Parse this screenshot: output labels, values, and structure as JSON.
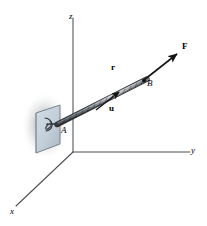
{
  "figure": {
    "type": "free-body-diagram",
    "background_color": "#ffffff",
    "stroke_color": "#1a1a1a",
    "plate_color": "#c3cfdb",
    "plate_edge_color": "#6e7a86",
    "shadow_color": "#b9bcc0"
  },
  "axes": {
    "origin": {
      "x": 73,
      "y": 152
    },
    "labels": {
      "x": "x",
      "y": "y",
      "z": "z"
    },
    "endpoints": {
      "x": {
        "x": 16,
        "y": 206
      },
      "y": {
        "x": 190,
        "y": 152
      },
      "z": {
        "x": 73,
        "y": 18
      }
    }
  },
  "points": [
    {
      "name": "A",
      "label": "A",
      "x": 62,
      "y": 128,
      "description": "cable anchor at eyebolt on plate"
    },
    {
      "name": "B",
      "label": "B",
      "x": 146,
      "y": 80,
      "description": "point along the cable"
    }
  ],
  "vectors": [
    {
      "name": "F",
      "label": "F",
      "bold": true,
      "label_x": 183,
      "label_y": 47,
      "description": "force vector acting along cable beyond B"
    },
    {
      "name": "r",
      "label": "r",
      "bold": true,
      "label_x": 112,
      "label_y": 67,
      "description": "position vector from A to B"
    },
    {
      "name": "u",
      "label": "u",
      "bold": true,
      "label_x": 110,
      "label_y": 107,
      "description": "unit vector in direction of the cable"
    }
  ],
  "elements": {
    "plate": "mounting-plate",
    "eyebolt": "eyebolt-at-A",
    "cable": "braided-cable-A-to-B",
    "shadow": "soft-drop-shadow-behind-plate"
  }
}
